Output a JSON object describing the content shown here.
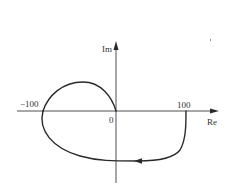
{
  "diagram": {
    "type": "nyquist-plot",
    "axes": {
      "real_label": "Re",
      "imag_label": "Im",
      "origin_label": "0"
    },
    "tick_labels": {
      "neg": "−100",
      "pos": "100"
    },
    "tick_values": {
      "neg": -100,
      "pos": 100
    },
    "curve": {
      "description": "Closed contour passing through the origin, crossing the real axis at -100, extending to +100 on the real axis and looping below the real axis back toward the left",
      "direction_arrow": "left",
      "real_axis_crossings": [
        -100,
        0,
        100
      ]
    },
    "colors": {
      "ink": "#2a2a2a",
      "background": "#ffffff"
    }
  }
}
